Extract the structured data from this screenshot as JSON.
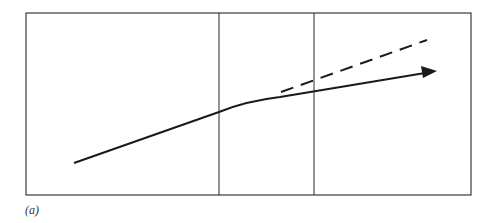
{
  "figure": {
    "caption": "(a)",
    "colors": {
      "frame": "#3a3a3a",
      "line": "#1a1a1a",
      "background": "#ffffff"
    },
    "frame": {
      "x": 26,
      "y": 13,
      "width": 445,
      "height": 182
    },
    "dividers": [
      {
        "x": 219
      },
      {
        "x": 314
      }
    ],
    "solid_path": {
      "description": "solid trajectory with bend, ending in arrowhead",
      "points": [
        [
          74,
          163
        ],
        [
          219,
          112
        ],
        [
          280,
          98
        ],
        [
          433,
          72
        ]
      ]
    },
    "dashed_path": {
      "description": "dashed extrapolation of initial trend",
      "points": [
        [
          281,
          93
        ],
        [
          427,
          40
        ]
      ]
    },
    "arrowhead": {
      "tip": [
        437,
        71
      ]
    }
  }
}
